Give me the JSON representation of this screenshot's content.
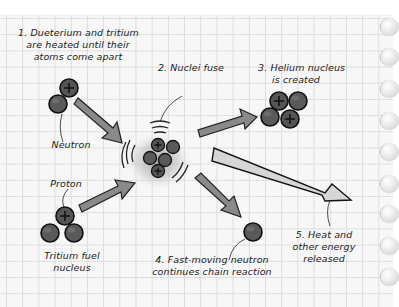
{
  "diagram": {
    "steps": [
      {
        "id": 1,
        "label_line1": "1. Dueterium and tritium",
        "label_line2": "are heated until their",
        "label_line3": "atoms come apart"
      },
      {
        "id": 2,
        "label_line1": "2. Nuclei fuse"
      },
      {
        "id": 3,
        "label_line1": "3. Helium nucleus",
        "label_line2": "is created"
      },
      {
        "id": 4,
        "label_line1": "4. Fast-moving neutron",
        "label_line2": "continues chain reaction"
      },
      {
        "id": 5,
        "label_line1": "5. Heat and",
        "label_line2": "other energy",
        "label_line3": "released"
      }
    ],
    "callouts": {
      "neutron": "Neutron",
      "proton": "Proton",
      "tritium_line1": "Tritium fuel",
      "tritium_line2": "nucleus"
    },
    "colors": {
      "paper": "#f7f7f7",
      "grid": "#dcdcdc",
      "particle": "#5a5a5a",
      "arrow": "#8a8a8a",
      "energy_arrow": "#d6d6d6",
      "ink": "#1b1b1b"
    },
    "icons": [
      "plus-sign-icon",
      "arrow-icon",
      "spiral-ring-icon"
    ]
  }
}
